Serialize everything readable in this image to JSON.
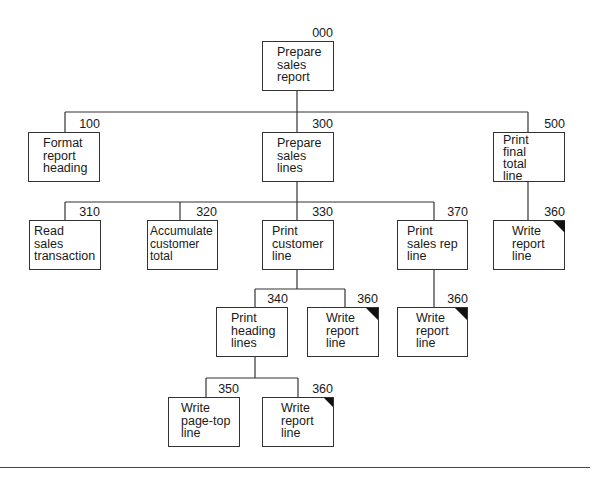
{
  "diagram": {
    "type": "structure-chart",
    "modules": [
      {
        "id": "000",
        "label": "Prepare\nsales\nreport"
      },
      {
        "id": "100",
        "label": "Format\nreport\nheading"
      },
      {
        "id": "300",
        "label": "Prepare\nsales\nlines"
      },
      {
        "id": "500",
        "label": "Print\nfinal\ntotal\nline"
      },
      {
        "id": "310",
        "label": "Read\nsales\ntransaction"
      },
      {
        "id": "320",
        "label": "Accumulate\ncustomer\ntotal"
      },
      {
        "id": "330",
        "label": "Print\ncustomer\nline"
      },
      {
        "id": "370",
        "label": "Print\nsales rep\nline"
      },
      {
        "id": "360",
        "label": "Write\nreport\nline",
        "common_module": true,
        "parent": "500"
      },
      {
        "id": "340",
        "label": "Print\nheading\nlines"
      },
      {
        "id": "360",
        "label": "Write\nreport\nline",
        "common_module": true,
        "parent": "330"
      },
      {
        "id": "360",
        "label": "Write\nreport\nline",
        "common_module": true,
        "parent": "370"
      },
      {
        "id": "350",
        "label": "Write\npage-top\nline"
      },
      {
        "id": "360",
        "label": "Write\nreport\nline",
        "common_module": true,
        "parent": "340"
      }
    ],
    "edges": [
      [
        "000",
        "100"
      ],
      [
        "000",
        "300"
      ],
      [
        "000",
        "500"
      ],
      [
        "300",
        "310"
      ],
      [
        "300",
        "320"
      ],
      [
        "300",
        "330"
      ],
      [
        "300",
        "370"
      ],
      [
        "500",
        "360"
      ],
      [
        "330",
        "340"
      ],
      [
        "330",
        "360"
      ],
      [
        "370",
        "360"
      ],
      [
        "340",
        "350"
      ],
      [
        "340",
        "360"
      ]
    ],
    "legend_note": "Shaded corner marks a common module (360)"
  }
}
